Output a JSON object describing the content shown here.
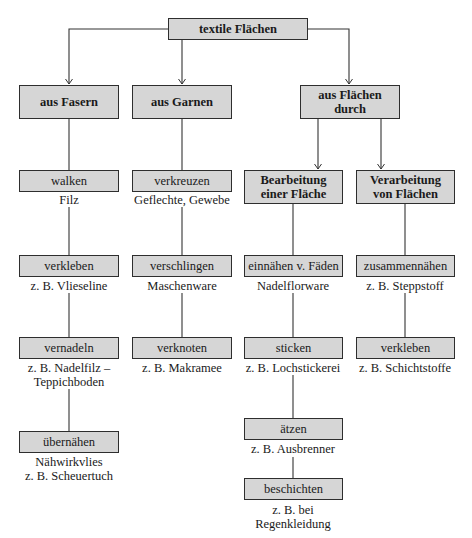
{
  "colors": {
    "box_fill": "#d6d6d6",
    "box_border": "#2e2e2e",
    "line": "#333333"
  },
  "root": {
    "label": "textile Flächen"
  },
  "categories": [
    {
      "label": "aus Fasern"
    },
    {
      "label": "aus Garnen"
    },
    {
      "label": "aus Flächen durch",
      "lines": [
        "aus Flächen",
        "durch"
      ]
    }
  ],
  "subcategories": [
    {
      "lines": [
        "Bearbeitung",
        "einer Fläche"
      ]
    },
    {
      "lines": [
        "Verarbeitung",
        "von Flächen"
      ]
    }
  ],
  "columns": {
    "fasern": [
      {
        "process": "walken",
        "example": [
          "Filz"
        ]
      },
      {
        "process": "verkleben",
        "example": [
          "z. B. Vlieseline"
        ]
      },
      {
        "process": "vernadeln",
        "example": [
          "z. B. Nadelfilz –",
          "Teppichboden"
        ]
      },
      {
        "process": "übernähen",
        "example": [
          "Nähwirkvlies",
          "z. B. Scheuertuch"
        ]
      }
    ],
    "garnen": [
      {
        "process": "verkreuzen",
        "example": [
          "Geflechte, Gewebe"
        ]
      },
      {
        "process": "verschlingen",
        "example": [
          "Maschenware"
        ]
      },
      {
        "process": "verknoten",
        "example": [
          "z. B. Makramee"
        ]
      }
    ],
    "bearbeitung": [
      {
        "process": "einnähen v. Fäden",
        "example": [
          "Nadelflorware"
        ]
      },
      {
        "process": "sticken",
        "example": [
          "z. B. Lochstickerei"
        ]
      },
      {
        "process": "ätzen",
        "example": [
          "z. B. Ausbrenner"
        ]
      },
      {
        "process": "beschichten",
        "example": [
          "z. B. bei",
          "Regenkleidung"
        ]
      }
    ],
    "verarbeitung": [
      {
        "process": "zusammennähen",
        "example": [
          "z. B. Steppstoff"
        ]
      },
      {
        "process": "verkleben",
        "example": [
          "z. B. Schichtstoffe"
        ]
      }
    ]
  }
}
